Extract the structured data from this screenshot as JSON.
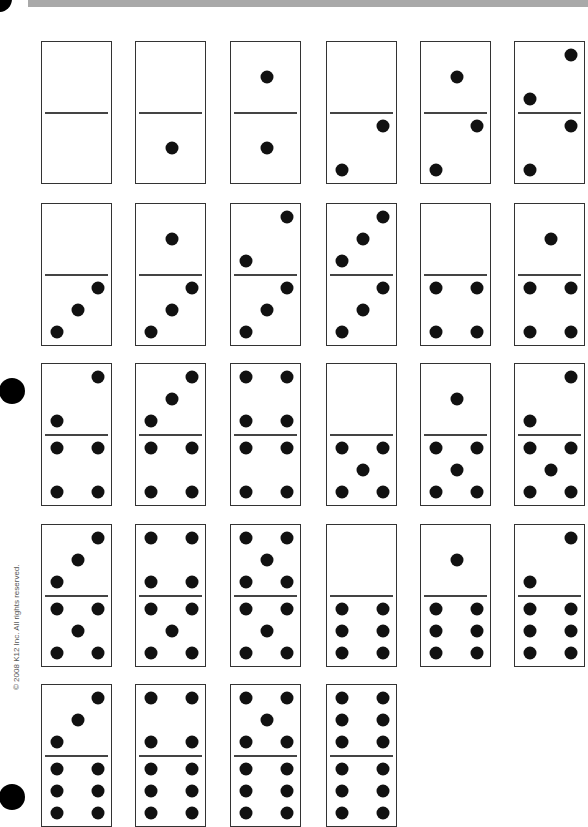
{
  "page": {
    "copyright": "© 2008 K12 Inc. All rights reserved.",
    "top_bar_color": "#a9a9a9"
  },
  "layout": {
    "col_x": [
      41,
      135,
      230,
      326,
      420,
      514
    ],
    "row_y": [
      41,
      203,
      363,
      524,
      684
    ]
  },
  "dominoes": [
    {
      "row": 0,
      "col": 0,
      "top": 0,
      "bottom": 0
    },
    {
      "row": 0,
      "col": 1,
      "top": 0,
      "bottom": 1
    },
    {
      "row": 0,
      "col": 2,
      "top": 1,
      "bottom": 1
    },
    {
      "row": 0,
      "col": 3,
      "top": 0,
      "bottom": 2
    },
    {
      "row": 0,
      "col": 4,
      "top": 1,
      "bottom": 2
    },
    {
      "row": 0,
      "col": 5,
      "top": 2,
      "bottom": 2
    },
    {
      "row": 1,
      "col": 0,
      "top": 0,
      "bottom": 3
    },
    {
      "row": 1,
      "col": 1,
      "top": 1,
      "bottom": 3
    },
    {
      "row": 1,
      "col": 2,
      "top": 2,
      "bottom": 3
    },
    {
      "row": 1,
      "col": 3,
      "top": 3,
      "bottom": 3
    },
    {
      "row": 1,
      "col": 4,
      "top": 0,
      "bottom": 4
    },
    {
      "row": 1,
      "col": 5,
      "top": 1,
      "bottom": 4
    },
    {
      "row": 2,
      "col": 0,
      "top": 2,
      "bottom": 4
    },
    {
      "row": 2,
      "col": 1,
      "top": 3,
      "bottom": 4
    },
    {
      "row": 2,
      "col": 2,
      "top": 4,
      "bottom": 4
    },
    {
      "row": 2,
      "col": 3,
      "top": 0,
      "bottom": 5
    },
    {
      "row": 2,
      "col": 4,
      "top": 1,
      "bottom": 5
    },
    {
      "row": 2,
      "col": 5,
      "top": 2,
      "bottom": 5
    },
    {
      "row": 3,
      "col": 0,
      "top": 3,
      "bottom": 5
    },
    {
      "row": 3,
      "col": 1,
      "top": 4,
      "bottom": 5
    },
    {
      "row": 3,
      "col": 2,
      "top": 5,
      "bottom": 5
    },
    {
      "row": 3,
      "col": 3,
      "top": 0,
      "bottom": 6
    },
    {
      "row": 3,
      "col": 4,
      "top": 1,
      "bottom": 6
    },
    {
      "row": 3,
      "col": 5,
      "top": 2,
      "bottom": 6
    },
    {
      "row": 4,
      "col": 0,
      "top": 3,
      "bottom": 6
    },
    {
      "row": 4,
      "col": 1,
      "top": 4,
      "bottom": 6
    },
    {
      "row": 4,
      "col": 2,
      "top": 5,
      "bottom": 6
    },
    {
      "row": 4,
      "col": 3,
      "top": 6,
      "bottom": 6
    }
  ],
  "pip_positions": {
    "0": [],
    "1": [
      [
        0.5,
        0.5
      ]
    ],
    "2": [
      [
        0.8,
        0.15
      ],
      [
        0.2,
        0.85
      ]
    ],
    "3": [
      [
        0.8,
        0.15
      ],
      [
        0.5,
        0.5
      ],
      [
        0.2,
        0.85
      ]
    ],
    "4": [
      [
        0.2,
        0.15
      ],
      [
        0.8,
        0.15
      ],
      [
        0.2,
        0.85
      ],
      [
        0.8,
        0.85
      ]
    ],
    "5": [
      [
        0.2,
        0.15
      ],
      [
        0.8,
        0.15
      ],
      [
        0.5,
        0.5
      ],
      [
        0.2,
        0.85
      ],
      [
        0.8,
        0.85
      ]
    ],
    "6": [
      [
        0.2,
        0.15
      ],
      [
        0.8,
        0.15
      ],
      [
        0.2,
        0.5
      ],
      [
        0.8,
        0.5
      ],
      [
        0.2,
        0.85
      ],
      [
        0.8,
        0.85
      ]
    ]
  }
}
